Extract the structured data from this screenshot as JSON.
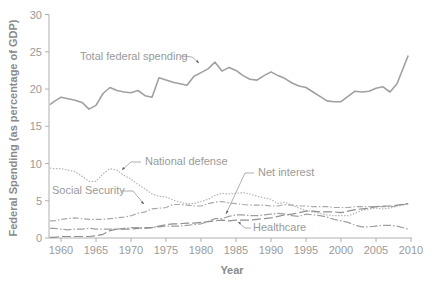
{
  "chart_data": {
    "type": "line",
    "title": "",
    "xlabel": "Year",
    "ylabel": "Federal Spending (as percentage of GDP)",
    "xlim": [
      1958,
      2010
    ],
    "ylim": [
      0,
      30
    ],
    "x_ticks": [
      "1960",
      "1965",
      "1970",
      "1975",
      "1980",
      "1985",
      "1990",
      "1995",
      "2000",
      "2005",
      "2010"
    ],
    "y_ticks": [
      "0",
      "5",
      "10",
      "15",
      "20",
      "25",
      "30"
    ],
    "grid": false,
    "legend": "inline annotations",
    "x": [
      1958,
      1959,
      1960,
      1961,
      1962,
      1963,
      1964,
      1965,
      1966,
      1967,
      1968,
      1969,
      1970,
      1971,
      1972,
      1973,
      1974,
      1975,
      1976,
      1977,
      1978,
      1979,
      1980,
      1981,
      1982,
      1983,
      1984,
      1985,
      1986,
      1987,
      1988,
      1989,
      1990,
      1991,
      1992,
      1993,
      1994,
      1995,
      1996,
      1997,
      1998,
      1999,
      2000,
      2001,
      2002,
      2003,
      2004,
      2005,
      2006,
      2007,
      2008,
      2009
    ],
    "series": [
      {
        "name": "Total federal spending",
        "color": "#a0a0a0",
        "style": "solid",
        "values": [
          17.9,
          18.3,
          18.9,
          18.7,
          18.5,
          18.2,
          17.3,
          17.8,
          19.4,
          20.2,
          19.8,
          19.6,
          19.5,
          19.8,
          19.1,
          18.9,
          21.5,
          21.2,
          20.9,
          20.7,
          20.5,
          21.7,
          22.2,
          22.7,
          23.6,
          22.4,
          22.9,
          22.5,
          21.8,
          21.3,
          21.2,
          21.8,
          22.3,
          21.8,
          21.4,
          20.8,
          20.4,
          20.2,
          19.6,
          19.0,
          18.4,
          18.3,
          18.3,
          19.0,
          19.7,
          19.6,
          19.7,
          20.1,
          20.3,
          19.6,
          20.7,
          24.5
        ]
      },
      {
        "name": "National defense",
        "color": "#b4b4b4",
        "style": "dotted",
        "values": [
          9.4,
          9.3,
          9.3,
          9.1,
          8.9,
          8.3,
          7.6,
          7.6,
          8.6,
          9.3,
          9.1,
          8.4,
          7.9,
          7.2,
          6.6,
          5.9,
          5.6,
          5.5,
          5.1,
          4.8,
          4.6,
          4.6,
          4.9,
          5.2,
          5.7,
          6.0,
          5.9,
          6.0,
          6.1,
          5.9,
          5.6,
          5.4,
          5.2,
          4.6,
          4.8,
          4.4,
          4.0,
          3.7,
          3.5,
          3.3,
          3.1,
          3.0,
          3.0,
          3.0,
          3.3,
          3.7,
          3.9,
          4.0,
          3.9,
          4.0,
          4.3,
          4.6
        ]
      },
      {
        "name": "Social Security",
        "color": "#a8a8a8",
        "style": "dashdot",
        "values": [
          2.3,
          2.3,
          2.5,
          2.6,
          2.7,
          2.6,
          2.5,
          2.5,
          2.5,
          2.6,
          2.7,
          2.8,
          3.0,
          3.3,
          3.5,
          3.9,
          4.0,
          4.1,
          4.5,
          4.5,
          4.4,
          4.3,
          4.3,
          4.6,
          4.8,
          4.9,
          4.7,
          4.6,
          4.5,
          4.4,
          4.4,
          4.4,
          4.3,
          4.3,
          4.5,
          4.4,
          4.3,
          4.3,
          4.2,
          4.2,
          4.2,
          4.1,
          4.1,
          4.1,
          4.2,
          4.2,
          4.2,
          4.2,
          4.2,
          4.2,
          4.3,
          4.6
        ]
      },
      {
        "name": "Net interest",
        "color": "#a0a0a0",
        "style": "dash-dot-long",
        "values": [
          1.3,
          1.3,
          1.2,
          1.1,
          1.2,
          1.2,
          1.3,
          1.2,
          1.2,
          1.2,
          1.2,
          1.3,
          1.4,
          1.4,
          1.3,
          1.4,
          1.5,
          1.6,
          1.6,
          1.6,
          1.7,
          1.8,
          1.9,
          2.2,
          2.6,
          2.6,
          2.9,
          3.1,
          3.1,
          3.0,
          3.0,
          3.1,
          3.2,
          3.3,
          3.2,
          3.0,
          2.9,
          3.2,
          3.1,
          3.0,
          2.8,
          2.5,
          2.3,
          2.1,
          1.7,
          1.5,
          1.5,
          1.6,
          1.7,
          1.7,
          1.6,
          1.2
        ]
      },
      {
        "name": "Healthcare",
        "color": "#909090",
        "style": "long-dash",
        "values": [
          0.1,
          0.1,
          0.2,
          0.2,
          0.2,
          0.2,
          0.2,
          0.3,
          0.5,
          1.0,
          1.2,
          1.2,
          1.2,
          1.3,
          1.4,
          1.4,
          1.6,
          1.8,
          1.9,
          1.9,
          2.0,
          2.0,
          2.1,
          2.2,
          2.3,
          2.4,
          2.3,
          2.4,
          2.4,
          2.4,
          2.5,
          2.6,
          2.7,
          2.9,
          3.1,
          3.2,
          3.4,
          3.6,
          3.6,
          3.5,
          3.5,
          3.5,
          3.4,
          3.6,
          3.8,
          3.9,
          4.0,
          4.2,
          4.3,
          4.3,
          4.4,
          4.6
        ]
      }
    ],
    "annotations": [
      {
        "text": "Total federal spending",
        "target_series": "Total federal spending"
      },
      {
        "text": "National defense",
        "target_series": "National defense"
      },
      {
        "text": "Social Security",
        "target_series": "Social Security"
      },
      {
        "text": "Net interest",
        "target_series": "Net interest"
      },
      {
        "text": "Healthcare",
        "target_series": "Healthcare"
      }
    ]
  },
  "labels": {
    "ylabel": "Federal Spending (as percentage of GDP)",
    "xlabel": "Year",
    "ann_total": "Total federal spending",
    "ann_defense": "National defense",
    "ann_ss": "Social Security",
    "ann_interest": "Net interest",
    "ann_health": "Healthcare"
  }
}
